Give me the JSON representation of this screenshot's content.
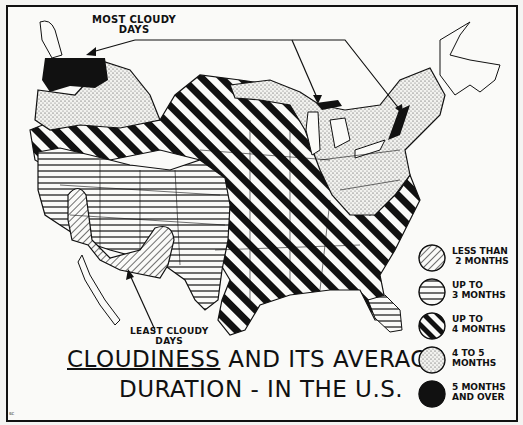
{
  "title": {
    "line1_underlined": "Cloudiness",
    "line1_rest": "and Its Average",
    "line2": "Duration - in the U.S."
  },
  "callouts": {
    "most_cloudy": "MOST CLOUDY\nDAYS",
    "least_cloudy": "LEAST CLOUDY\nDAYS"
  },
  "legend": [
    {
      "pattern": "diagonal-thin-hatch",
      "label": "LESS THAN\n 2 MONTHS"
    },
    {
      "pattern": "horizontal-lines",
      "label": "UP TO\n3 MONTHS"
    },
    {
      "pattern": "bold-diagonal-stripes",
      "label": "UP TO\n4 MONTHS"
    },
    {
      "pattern": "stipple-dots",
      "label": "4 TO 5\nMONTHS"
    },
    {
      "pattern": "solid-black",
      "label": "5 MONTHS\nAND OVER"
    }
  ],
  "signature": "sc",
  "colors": {
    "ink": "#111111",
    "paper": "#fafaf8"
  }
}
